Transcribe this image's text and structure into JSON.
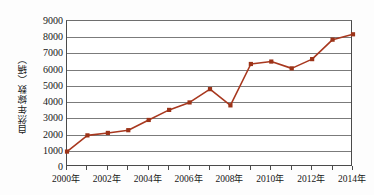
{
  "chart_data": {
    "type": "line",
    "title": "",
    "xlabel": "",
    "ylabel": "自然年嫁数（辆）",
    "categories": [
      "2000年",
      "2001年",
      "2002年",
      "2003年",
      "2004年",
      "2005年",
      "2006年",
      "2007年",
      "2008年",
      "2009年",
      "2010年",
      "2011年",
      "2012年",
      "2013年",
      "2014年"
    ],
    "x": [
      2000,
      2001,
      2002,
      2003,
      2004,
      2005,
      2006,
      2007,
      2008,
      2009,
      2010,
      2011,
      2012,
      2013,
      2014
    ],
    "values": [
      950,
      1950,
      2100,
      2270,
      2900,
      3520,
      3980,
      4800,
      3800,
      6350,
      6500,
      6080,
      6650,
      7850,
      8180
    ],
    "series": [
      {
        "name": "自然年嫁数",
        "values": [
          950,
          1950,
          2100,
          2270,
          2900,
          3520,
          3980,
          4800,
          3800,
          6350,
          6500,
          6080,
          6650,
          7850,
          8180
        ]
      }
    ],
    "ylim": [
      0,
      9000
    ],
    "xlim": [
      2000,
      2014
    ],
    "yticks": [
      0,
      1000,
      2000,
      3000,
      4000,
      5000,
      6000,
      7000,
      8000,
      9000
    ],
    "ytick_labels": [
      "0",
      "1000",
      "2000",
      "3000",
      "4000",
      "5000",
      "6000",
      "7000",
      "8000",
      "9000"
    ],
    "xticks": [
      2000,
      2001,
      2002,
      2003,
      2004,
      2005,
      2006,
      2007,
      2008,
      2009,
      2010,
      2011,
      2012,
      2013,
      2014
    ],
    "xtick_labels_shown": [
      "2000年",
      "",
      "2002年",
      "",
      "2004年",
      "",
      "2006年",
      "",
      "2008年",
      "",
      "2010年",
      "",
      "2012年",
      "",
      "2014年"
    ],
    "grid": true,
    "grid_axis": "y",
    "legend": false,
    "legend_position": "none",
    "marker": "square",
    "line_color": "#a8381f",
    "marker_color": "#9c3318",
    "grid_color": "#7b7b7b",
    "axis_color": "#4a4a4a",
    "background": "#ffffff"
  }
}
